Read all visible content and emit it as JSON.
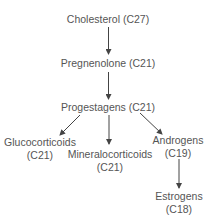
{
  "diagram": {
    "colors": {
      "text": "#555555",
      "arrow": "#444444",
      "background": "#ffffff"
    },
    "nodes": {
      "cholesterol": {
        "name": "Cholesterol",
        "carbons": "(C27)",
        "label": "Cholesterol (C27)"
      },
      "pregnenolone": {
        "name": "Pregnenolone",
        "carbons": "(C21)",
        "label": "Pregnenolone (C21)"
      },
      "progestagens": {
        "name": "Progestagens",
        "carbons": "(C21)",
        "label": "Progestagens (C21)"
      },
      "glucocorticoids": {
        "name": "Glucocorticoids",
        "carbons": "(C21)"
      },
      "mineralocorticoids": {
        "name": "Mineralocorticoids",
        "carbons": "(C21)"
      },
      "androgens": {
        "name": "Androgens",
        "carbons": "(C19)"
      },
      "estrogens": {
        "name": "Estrogens",
        "carbons": "(C18)"
      }
    },
    "edges": [
      {
        "from": "cholesterol",
        "to": "pregnenolone"
      },
      {
        "from": "pregnenolone",
        "to": "progestagens"
      },
      {
        "from": "progestagens",
        "to": "glucocorticoids"
      },
      {
        "from": "progestagens",
        "to": "mineralocorticoids"
      },
      {
        "from": "progestagens",
        "to": "androgens"
      },
      {
        "from": "androgens",
        "to": "estrogens"
      }
    ]
  }
}
